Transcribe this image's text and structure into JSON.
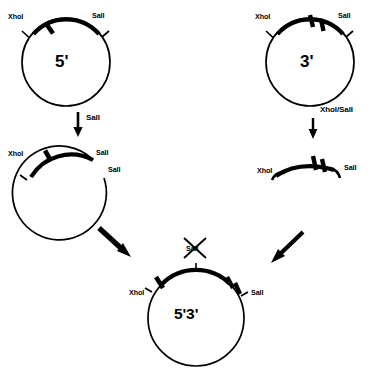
{
  "diagram": {
    "colors": {
      "stroke": "#000000",
      "background": "#ffffff"
    },
    "nodes": {
      "plasmid_5prime": {
        "name": "5'",
        "site_left": "XhoI",
        "site_right": "SalI"
      },
      "plasmid_3prime": {
        "name": "3'",
        "site_left": "XhoI",
        "site_right": "SalI"
      },
      "linearized_5prime": {
        "site_left": "XhoI",
        "site_cut_upper": "SalI",
        "site_cut_lower": "SalI"
      },
      "fragment_3prime": {
        "site_left": "XhoI",
        "site_right": "SalI"
      },
      "plasmid_final": {
        "name": "5'3'",
        "site_left": "XhoI",
        "site_right": "SalI",
        "site_destroyed": "SalI"
      }
    },
    "arrows": {
      "left_digest_label": "SalI",
      "right_digest_label": "XhoI/SalI",
      "ligate_left_label": "",
      "ligate_right_label": ""
    }
  }
}
